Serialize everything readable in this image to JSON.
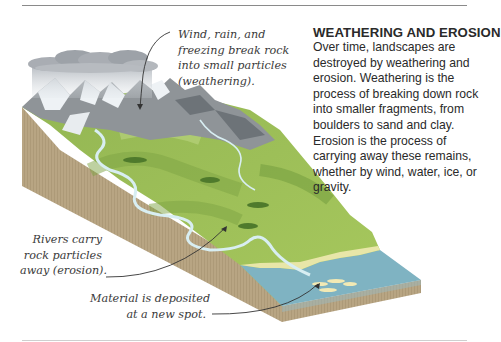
{
  "panel": {
    "title": "WEATHERING AND EROSION",
    "body": "Over time, landscapes are destroyed by weathering and erosion. Weathering is the process of breaking down rock into smaller fragments, from boulders to sand and clay. Erosion is the process of carrying away these remains, whether by wind, water, ice, or gravity."
  },
  "annotations": {
    "weathering": [
      "Wind, rain, and",
      "freezing break rock",
      "into small particles",
      "(weathering)."
    ],
    "erosion": [
      "Rivers carry",
      "rock particles",
      "away (erosion)."
    ],
    "deposition": [
      "Material is deposited",
      "at a new spot."
    ]
  },
  "colors": {
    "soil_side": "#b8a583",
    "grass_light": "#a9c95e",
    "grass_dark": "#6f9a3c",
    "rock": "#8f9498",
    "snow": "#eef2f5",
    "water": "#7fb3c2",
    "river": "#d8eef2",
    "sand": "#f2e9b4",
    "cloud": "#a9adb3",
    "text": "#2a2a2a"
  }
}
